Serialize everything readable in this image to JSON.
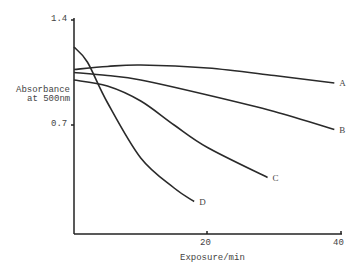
{
  "chart_data": {
    "type": "line",
    "title": "",
    "xlabel": "Exposure/min",
    "ylabel": "Absorbance at 500nm",
    "ylabel_lines": [
      "Absorbance",
      "at 500nm"
    ],
    "xlim": [
      0,
      40
    ],
    "ylim": [
      0,
      1.4
    ],
    "x_ticks": [
      "20",
      "40"
    ],
    "y_ticks": [
      "1.4",
      "0.7"
    ],
    "grid": false,
    "legend": "inline labels at curve ends",
    "series": [
      {
        "name": "A",
        "x": [
          0,
          5,
          10,
          20,
          30,
          39
        ],
        "values": [
          1.07,
          1.09,
          1.1,
          1.08,
          1.03,
          0.98
        ]
      },
      {
        "name": "B",
        "x": [
          0,
          5,
          10,
          20,
          30,
          39
        ],
        "values": [
          1.05,
          1.03,
          1.0,
          0.9,
          0.79,
          0.67
        ]
      },
      {
        "name": "C",
        "x": [
          0,
          5,
          10,
          15,
          20,
          29
        ],
        "values": [
          1.0,
          0.96,
          0.86,
          0.7,
          0.55,
          0.35
        ]
      },
      {
        "name": "D",
        "x": [
          0,
          2,
          5,
          10,
          15,
          18
        ],
        "values": [
          1.22,
          1.12,
          0.85,
          0.48,
          0.28,
          0.19
        ]
      }
    ]
  }
}
